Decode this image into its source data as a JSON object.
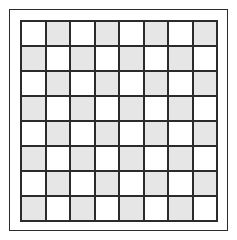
{
  "figure": {
    "type": "checkerboard-grid"
  },
  "board": {
    "rows": 8,
    "columns": 8,
    "total_cells": 64,
    "top_left_cell_shade": "light",
    "pattern": "alternating",
    "cells": [
      [
        "light",
        "dark",
        "light",
        "dark",
        "light",
        "dark",
        "light",
        "dark"
      ],
      [
        "dark",
        "light",
        "dark",
        "light",
        "dark",
        "light",
        "dark",
        "light"
      ],
      [
        "light",
        "dark",
        "light",
        "dark",
        "light",
        "dark",
        "light",
        "dark"
      ],
      [
        "dark",
        "light",
        "dark",
        "light",
        "dark",
        "light",
        "dark",
        "light"
      ],
      [
        "light",
        "dark",
        "light",
        "dark",
        "light",
        "dark",
        "light",
        "dark"
      ],
      [
        "dark",
        "light",
        "dark",
        "light",
        "dark",
        "light",
        "dark",
        "light"
      ],
      [
        "light",
        "dark",
        "light",
        "dark",
        "light",
        "dark",
        "light",
        "dark"
      ],
      [
        "dark",
        "light",
        "dark",
        "light",
        "dark",
        "light",
        "dark",
        "light"
      ]
    ]
  },
  "colors": {
    "light_square": "#ffffff",
    "dark_square": "#e6e6e6",
    "grid_line": "#2b2b2b",
    "outer_frame": "#2b2b2b",
    "background": "#ffffff"
  },
  "geometry": {
    "canvas_width": 237,
    "canvas_height": 240,
    "outer_frame_left": 9,
    "outer_frame_top": 9,
    "outer_frame_width": 219,
    "outer_frame_height": 222,
    "outer_frame_border_width": 1,
    "board_left": 20,
    "board_top": 20,
    "board_width": 198,
    "board_height": 202,
    "board_border_width": 2,
    "grid_line_width": 2
  }
}
